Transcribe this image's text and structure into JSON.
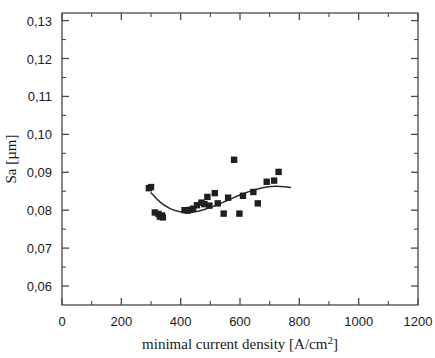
{
  "chart_data": {
    "type": "scatter",
    "title": "",
    "xlabel": "minimal current density [A/cm²]",
    "ylabel": "Sa [µm]",
    "xlim": [
      0,
      1200
    ],
    "ylim": [
      0.055,
      0.132
    ],
    "grid": false,
    "legend": null,
    "decimal_separator": ",",
    "x_ticks": [
      0,
      200,
      400,
      600,
      800,
      1000,
      1200
    ],
    "x_tick_labels": [
      "0",
      "200",
      "400",
      "600",
      "800",
      "1000",
      "1200"
    ],
    "x_minor_ticks": [
      100,
      300,
      500,
      700,
      900,
      1100
    ],
    "y_ticks": [
      0.06,
      0.07,
      0.08,
      0.09,
      0.1,
      0.11,
      0.12,
      0.13
    ],
    "y_tick_labels": [
      "0,06",
      "0,07",
      "0,08",
      "0,09",
      "0,10",
      "0,11",
      "0,12",
      "0,13"
    ],
    "y_minor_ticks": [
      0.065,
      0.075,
      0.085,
      0.095,
      0.105,
      0.115,
      0.125
    ],
    "marker": "square",
    "marker_color": "#1f1f1f",
    "series": [
      {
        "name": "Sa measurements",
        "x": [
          293,
          300,
          313,
          325,
          330,
          337,
          340,
          413,
          424,
          432,
          442,
          455,
          470,
          480,
          490,
          497,
          515,
          525,
          545,
          560,
          580,
          598,
          610,
          645,
          660,
          690,
          715,
          730
        ],
        "y": [
          0.0858,
          0.0861,
          0.0794,
          0.079,
          0.0783,
          0.0786,
          0.0781,
          0.08,
          0.0799,
          0.0801,
          0.0804,
          0.0813,
          0.082,
          0.0816,
          0.0835,
          0.0812,
          0.0845,
          0.0818,
          0.0791,
          0.0833,
          0.0933,
          0.0791,
          0.0838,
          0.0848,
          0.0818,
          0.0875,
          0.0878,
          0.0901
        ]
      }
    ],
    "fit_curve": {
      "name": "polynomial fit",
      "color": "#2b2b2b",
      "x": [
        300,
        330,
        360,
        390,
        420,
        450,
        480,
        510,
        540,
        570,
        600,
        630,
        660,
        690,
        720,
        750,
        770
      ],
      "y": [
        0.0846,
        0.0822,
        0.0806,
        0.0797,
        0.0794,
        0.0796,
        0.0802,
        0.081,
        0.082,
        0.083,
        0.084,
        0.0849,
        0.0856,
        0.0861,
        0.0863,
        0.0862,
        0.086
      ]
    }
  }
}
